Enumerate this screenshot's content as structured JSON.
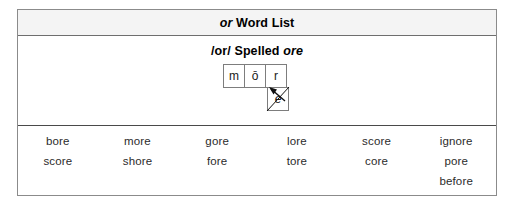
{
  "header": {
    "title_emphasis": "or",
    "title_rest": " Word List"
  },
  "subheader": {
    "text_prefix": "/or/ Spelled ",
    "text_emphasis": "ore"
  },
  "diagram": {
    "name": "sound-spelling-boxes",
    "boxes": [
      {
        "label": "m"
      },
      {
        "label": "ō"
      },
      {
        "label": "r"
      }
    ],
    "silent_letter_box": {
      "label": "e",
      "crossed_out": true
    },
    "arrow": {
      "from": "silent-e-box",
      "to": "long-o-box",
      "direction": "up-left"
    },
    "line_color": "#7d7d7d",
    "mark_color": "#111111"
  },
  "word_list": {
    "columns": 6,
    "rows": [
      [
        "bore",
        "more",
        "gore",
        "lore",
        "score",
        "ignore"
      ],
      [
        "score",
        "shore",
        "fore",
        "tore",
        "core",
        "pore"
      ],
      [
        "",
        "",
        "",
        "",
        "",
        "before"
      ]
    ]
  },
  "colors": {
    "outer_border": "#8b8b8b",
    "header_background": "#f4f4f4",
    "divider": "#4a4a4a",
    "text": "#000000",
    "word_text": "#2b2b2b"
  }
}
